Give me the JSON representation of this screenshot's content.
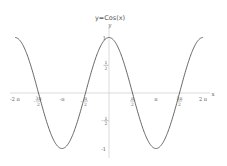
{
  "chart_data": {
    "type": "line",
    "title": "y=Cos(x)",
    "xlabel": "x",
    "ylabel": "y",
    "xlim": [
      -6.2832,
      6.2832
    ],
    "ylim": [
      -1,
      1
    ],
    "grid": false,
    "legend": null,
    "x_ticks": [
      {
        "value": -6.2832,
        "label": "-2 π"
      },
      {
        "value": -4.7124,
        "label": "-3π/2"
      },
      {
        "value": -3.1416,
        "label": "-π"
      },
      {
        "value": -1.5708,
        "label": "-π/2"
      },
      {
        "value": 1.5708,
        "label": "π/2"
      },
      {
        "value": 3.1416,
        "label": "π"
      },
      {
        "value": 4.7124,
        "label": "3π/2"
      },
      {
        "value": 6.2832,
        "label": "2 π"
      }
    ],
    "y_ticks": [
      {
        "value": 1,
        "label": "1"
      },
      {
        "value": 0.5,
        "label": "1/2"
      },
      {
        "value": -0.5,
        "label": "-1/2"
      },
      {
        "value": -1,
        "label": "-1"
      }
    ],
    "series": [
      {
        "name": "y=Cos(x)",
        "function": "cos(x)",
        "color": "#555555",
        "x": [
          -6.2832,
          -4.7124,
          -3.1416,
          -1.5708,
          0,
          1.5708,
          3.1416,
          4.7124,
          6.2832
        ],
        "y": [
          1,
          0,
          -1,
          0,
          1,
          0,
          -1,
          0,
          1
        ]
      }
    ]
  },
  "colors": {
    "axis": "#cccccc",
    "curve": "#555555",
    "text": "#555555"
  }
}
